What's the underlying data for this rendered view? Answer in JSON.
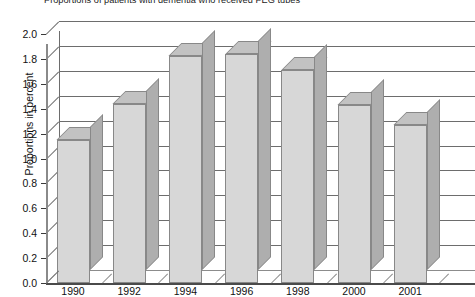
{
  "chart_data": {
    "type": "bar",
    "title": "Proportions of patients with dementia who received PEG tubes",
    "xlabel": "",
    "ylabel": "Proportions in percent",
    "categories": [
      "1990",
      "1992",
      "1994",
      "1996",
      "1998",
      "2000",
      "2001"
    ],
    "values": [
      1.15,
      1.44,
      1.82,
      1.84,
      1.71,
      1.43,
      1.27
    ],
    "ylim": [
      0.0,
      2.0
    ],
    "ytick_labels": [
      "0.0",
      "0.2",
      "0.4",
      "0.6",
      "0.8",
      "1.0",
      "1.2",
      "1.4",
      "1.6",
      "1.8",
      "2.0"
    ],
    "ytick_values": [
      0.0,
      0.2,
      0.4,
      0.6,
      0.8,
      1.0,
      1.2,
      1.4,
      1.6,
      1.8,
      2.0
    ],
    "grid": true,
    "legend": null,
    "legend_position": "none",
    "style": "3d-column",
    "colors": {
      "bar_front": "#d7d7d7",
      "bar_side": "#aeaeae",
      "bar_top": "#c2c2c2",
      "bar_outline": "#888888",
      "gridline": "#6d6d6d",
      "axis": "#4a4a4a",
      "text": "#111111",
      "background": "#ffffff"
    }
  }
}
